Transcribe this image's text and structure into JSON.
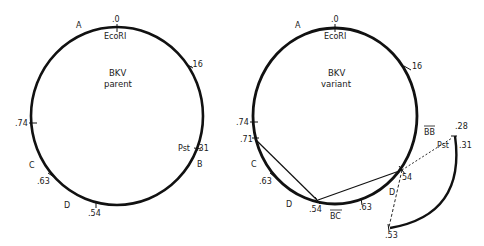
{
  "parent": {
    "title_line1": "BKV",
    "title_line2": "parent",
    "zero_label": ".0",
    "site_ecori": "EcoRI",
    "region_a": "A",
    "mark_16": ".16",
    "site_pst": "Pst",
    "mark_31": ".31",
    "region_b": "B",
    "mark_74": ".74",
    "region_c": "C",
    "mark_63": ".63",
    "region_d": "D",
    "mark_54": ".54"
  },
  "variant": {
    "title_line1": "BKV",
    "title_line2": "variant",
    "zero_label": ".0",
    "site_ecori": "EcoRI",
    "region_a": "A",
    "mark_16": "16",
    "mark_74": ".74",
    "mark_71": ".71",
    "region_c": "C",
    "mark_63_left": ".63",
    "region_d_left": "D",
    "mark_54_bottom": ".54",
    "region_bc": "BC",
    "mark_63_bottom": ".63",
    "mark_54_right": "54",
    "region_d_right": "D",
    "region_bb": "BB",
    "mark_28": ".28",
    "site_pst": "Pst",
    "mark_31": ".31",
    "mark_53": ".53"
  },
  "colors": {
    "line": "#111111",
    "background": "#ffffff"
  }
}
